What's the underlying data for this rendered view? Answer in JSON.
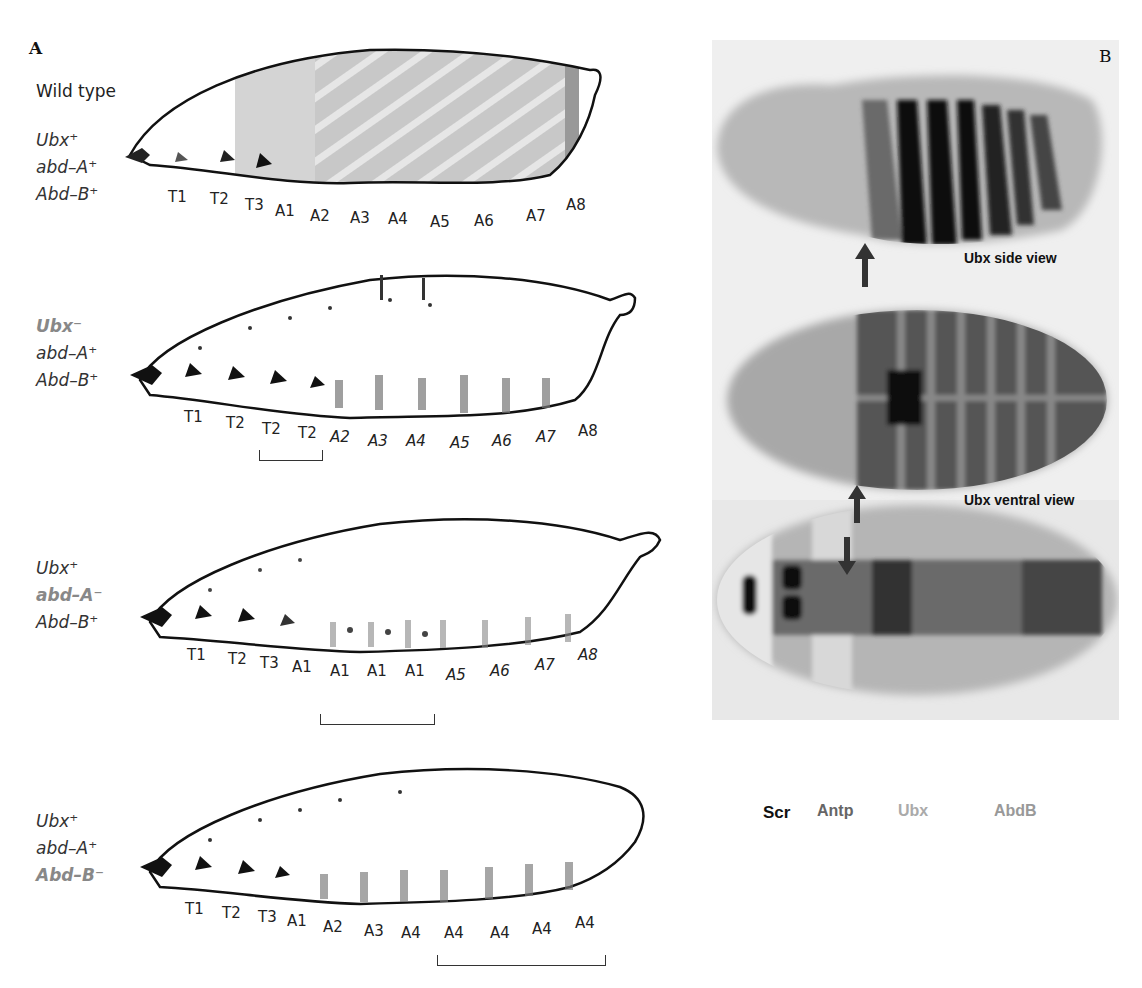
{
  "panels": {
    "A": {
      "letter": "A",
      "rows": [
        {
          "title": "Wild type",
          "genotype": [
            {
              "text": "Ubx⁺",
              "mutant": false
            },
            {
              "text": "abd–A⁺",
              "mutant": false
            },
            {
              "text": "Abd–B⁺",
              "mutant": false
            }
          ],
          "segments": [
            {
              "label": "T1",
              "italic": false
            },
            {
              "label": "T2",
              "italic": false
            },
            {
              "label": "T3",
              "italic": false
            },
            {
              "label": "A1",
              "italic": false
            },
            {
              "label": "A2",
              "italic": false
            },
            {
              "label": "A3",
              "italic": false
            },
            {
              "label": "A4",
              "italic": false
            },
            {
              "label": "A5",
              "italic": false
            },
            {
              "label": "A6",
              "italic": false
            },
            {
              "label": "A7",
              "italic": false
            },
            {
              "label": "A8",
              "italic": false
            }
          ]
        },
        {
          "genotype": [
            {
              "text": "Ubx⁻",
              "mutant": true
            },
            {
              "text": "abd–A⁺",
              "mutant": false
            },
            {
              "text": "Abd–B⁺",
              "mutant": false
            }
          ],
          "segments": [
            {
              "label": "T1",
              "italic": false
            },
            {
              "label": "T2",
              "italic": false
            },
            {
              "label": "T2",
              "italic": false
            },
            {
              "label": "T2",
              "italic": false
            },
            {
              "label": "A2",
              "italic": true
            },
            {
              "label": "A3",
              "italic": true
            },
            {
              "label": "A4",
              "italic": true
            },
            {
              "label": "A5",
              "italic": true
            },
            {
              "label": "A6",
              "italic": true
            },
            {
              "label": "A7",
              "italic": true
            },
            {
              "label": "A8",
              "italic": false
            }
          ],
          "bracket": "T2–T2 (transformed T3, A1)"
        },
        {
          "genotype": [
            {
              "text": "Ubx⁺",
              "mutant": false
            },
            {
              "text": "abd–A⁻",
              "mutant": true
            },
            {
              "text": "Abd–B⁺",
              "mutant": false
            }
          ],
          "segments": [
            {
              "label": "T1",
              "italic": false
            },
            {
              "label": "T2",
              "italic": false
            },
            {
              "label": "T3",
              "italic": false
            },
            {
              "label": "A1",
              "italic": false
            },
            {
              "label": "A1",
              "italic": false
            },
            {
              "label": "A1",
              "italic": false
            },
            {
              "label": "A1",
              "italic": false
            },
            {
              "label": "A5",
              "italic": true
            },
            {
              "label": "A6",
              "italic": true
            },
            {
              "label": "A7",
              "italic": true
            },
            {
              "label": "A8",
              "italic": true
            }
          ],
          "bracket": "A1–A1 (transformed A2–A4)"
        },
        {
          "genotype": [
            {
              "text": "Ubx⁺",
              "mutant": false
            },
            {
              "text": "abd–A⁺",
              "mutant": false
            },
            {
              "text": "Abd–B⁻",
              "mutant": true
            }
          ],
          "segments": [
            {
              "label": "T1",
              "italic": false
            },
            {
              "label": "T2",
              "italic": false
            },
            {
              "label": "T3",
              "italic": false
            },
            {
              "label": "A1",
              "italic": false
            },
            {
              "label": "A2",
              "italic": false
            },
            {
              "label": "A3",
              "italic": false
            },
            {
              "label": "A4",
              "italic": false
            },
            {
              "label": "A4",
              "italic": false
            },
            {
              "label": "A4",
              "italic": false
            },
            {
              "label": "A4",
              "italic": false
            },
            {
              "label": "A4",
              "italic": false
            }
          ],
          "bracket": "A4–A4 (transformed A5–A8)"
        }
      ]
    },
    "B": {
      "letter": "B",
      "captions": {
        "side": "Ubx side view",
        "ventral": "Ubx ventral view"
      },
      "genes": [
        {
          "label": "Scr",
          "color": "#111111"
        },
        {
          "label": "Antp",
          "color": "#666666"
        },
        {
          "label": "Ubx",
          "color": "#aaaaaa"
        },
        {
          "label": "AbdB",
          "color": "#999999"
        }
      ]
    }
  }
}
